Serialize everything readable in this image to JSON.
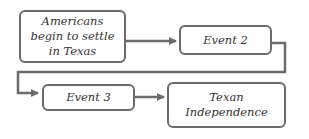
{
  "diagram": {
    "type": "flowchart",
    "nodes": [
      {
        "id": "n1",
        "label": "Americans\nbegin to settle\nin Texas"
      },
      {
        "id": "n2",
        "label": "Event 2"
      },
      {
        "id": "n3",
        "label": "Event 3"
      },
      {
        "id": "n4",
        "label": "Texan\nIndependence"
      }
    ],
    "edges": [
      {
        "from": "n1",
        "to": "n2"
      },
      {
        "from": "n2",
        "to": "n3"
      },
      {
        "from": "n3",
        "to": "n4"
      }
    ],
    "colors": {
      "stroke": "#6b6b6b",
      "text": "#333333",
      "background": "#ffffff"
    }
  }
}
